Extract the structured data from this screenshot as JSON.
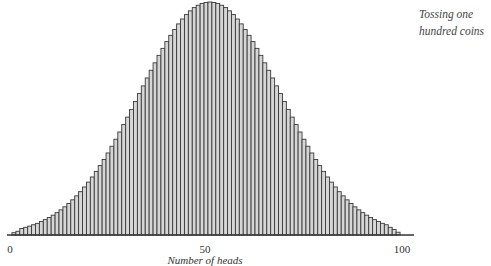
{
  "chart_data": {
    "type": "bar",
    "title": "Tossing one hundred coins",
    "xlabel": "Number of heads",
    "ylabel": "",
    "x_ticks": [
      "0",
      "50",
      "100"
    ],
    "x_range": [
      0,
      100
    ],
    "grid": false,
    "legend": null,
    "units": "relative height (% of peak)",
    "categories": [
      1,
      2,
      3,
      4,
      5,
      6,
      7,
      8,
      9,
      10,
      11,
      12,
      13,
      14,
      15,
      16,
      17,
      18,
      19,
      20,
      21,
      22,
      23,
      24,
      25,
      26,
      27,
      28,
      29,
      30,
      31,
      32,
      33,
      34,
      35,
      36,
      37,
      38,
      39,
      40,
      41,
      42,
      43,
      44,
      45,
      46,
      47,
      48,
      49,
      50,
      51,
      52,
      53,
      54,
      55,
      56,
      57,
      58,
      59,
      60,
      61,
      62,
      63,
      64,
      65,
      66,
      67,
      68,
      69,
      70,
      71,
      72,
      73,
      74,
      75,
      76,
      77,
      78,
      79,
      80,
      81,
      82,
      83,
      84,
      85,
      86,
      87,
      88,
      89,
      90,
      91,
      92,
      93,
      94,
      95,
      96,
      97,
      98,
      99
    ],
    "values": [
      1.0,
      1.6,
      2.8,
      3.3,
      3.8,
      4.4,
      5.0,
      5.8,
      6.6,
      7.5,
      8.5,
      9.6,
      10.8,
      12.1,
      13.5,
      15.1,
      16.8,
      18.6,
      20.6,
      22.7,
      24.9,
      27.3,
      29.8,
      32.4,
      35.2,
      38.1,
      41.1,
      44.2,
      47.4,
      50.6,
      53.9,
      57.3,
      60.7,
      64.0,
      67.4,
      70.7,
      73.9,
      77.1,
      80.1,
      83.0,
      85.7,
      88.2,
      90.6,
      92.7,
      94.6,
      96.2,
      97.6,
      98.6,
      99.4,
      99.8,
      100,
      99.8,
      99.4,
      98.6,
      97.6,
      96.2,
      94.6,
      92.7,
      90.6,
      88.2,
      85.7,
      83.0,
      80.1,
      77.1,
      73.9,
      70.7,
      67.4,
      64.0,
      60.7,
      57.3,
      53.9,
      50.6,
      47.4,
      44.2,
      41.1,
      38.1,
      35.2,
      32.4,
      29.8,
      27.3,
      24.9,
      22.7,
      20.6,
      18.6,
      16.8,
      15.1,
      13.5,
      12.1,
      10.8,
      9.6,
      8.5,
      7.5,
      6.6,
      5.8,
      5.0,
      4.4,
      3.3,
      2.4,
      1.2
    ],
    "colors": {
      "bar_fill": "#d6d6d6",
      "bar_stroke": "#3a3a3a",
      "axis": "#333333"
    }
  },
  "labels": {
    "title_line1": "Tossing one",
    "title_line2": "hundred coins",
    "tick_0": "0",
    "tick_50": "50",
    "tick_100": "100",
    "xlabel": "Number of heads"
  }
}
